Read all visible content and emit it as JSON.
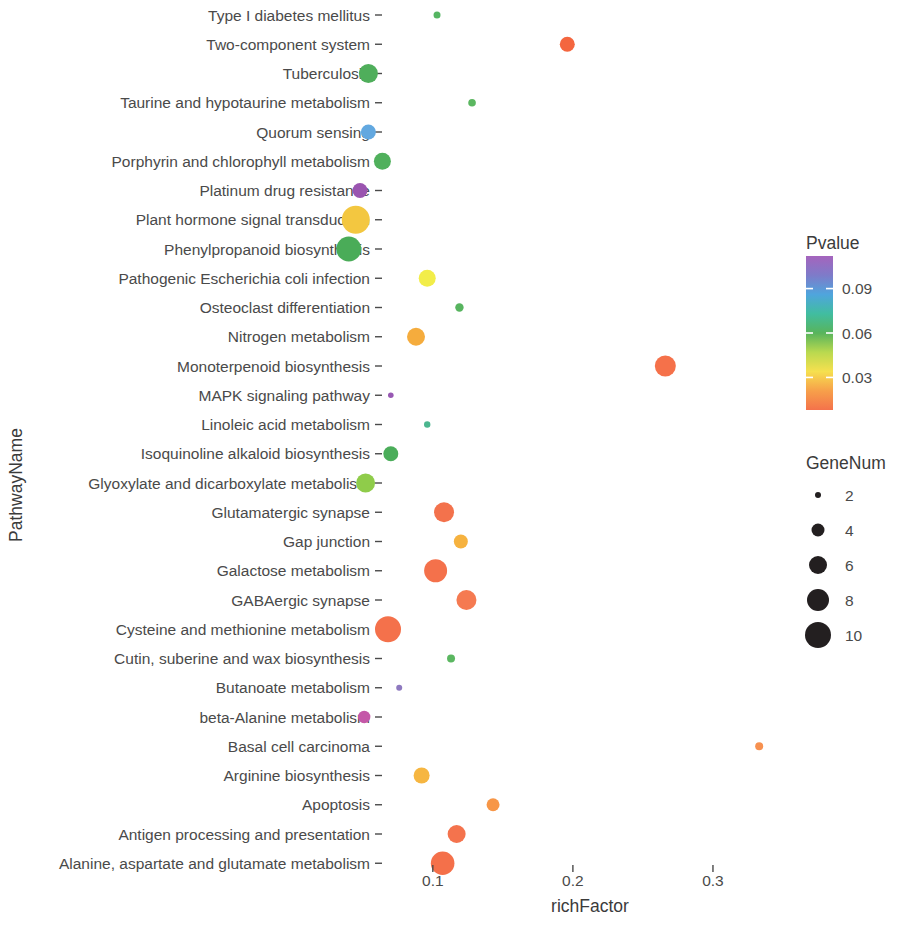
{
  "chart_data": {
    "type": "scatter",
    "title": "",
    "xlabel": "richFactor",
    "ylabel": "PathwayName",
    "xlim": [
      0.068,
      0.355
    ],
    "xticks": [
      0.1,
      0.2,
      0.3
    ],
    "xtick_labels": [
      "0.1",
      "0.2",
      "0.3"
    ],
    "grid": false,
    "legend_position": "right",
    "color_legend": {
      "title": "Pvalue",
      "ticks": [
        0.09,
        0.06,
        0.03
      ],
      "tick_labels": [
        "0.09",
        "0.06",
        "0.03"
      ],
      "range": [
        0.008,
        0.112
      ],
      "colormap": [
        "#f4724b",
        "#f7a04a",
        "#f6e04f",
        "#b9d94f",
        "#58b45c",
        "#41bda0",
        "#4fa5dd",
        "#7e7bc9",
        "#a564bd"
      ],
      "note": "rainbow scale: low p = orange/red (bottom), high p = purple (top)"
    },
    "size_legend": {
      "title": "GeneNum",
      "values": [
        2,
        4,
        6,
        8,
        10
      ],
      "labels": [
        "2",
        "4",
        "6",
        "8",
        "10"
      ],
      "radii": [
        3,
        6.5,
        9,
        11,
        13
      ],
      "color": "#231f20"
    },
    "categories": [
      "Type I diabetes mellitus",
      "Two-component system",
      "Tuberculosis",
      "Taurine and hypotaurine metabolism",
      "Quorum sensing",
      "Porphyrin and chlorophyll metabolism",
      "Platinum drug resistance",
      "Plant hormone signal transduction",
      "Phenylpropanoid biosynthesis",
      "Pathogenic Escherichia coli infection",
      "Osteoclast differentiation",
      "Nitrogen metabolism",
      "Monoterpenoid biosynthesis",
      "MAPK signaling pathway",
      "Linoleic acid metabolism",
      "Isoquinoline alkaloid biosynthesis",
      "Glyoxylate and dicarboxylate metabolism",
      "Glutamatergic synapse",
      "Gap junction",
      "Galactose metabolism",
      "GABAergic synapse",
      "Cysteine and methionine metabolism",
      "Cutin, suberine and wax biosynthesis",
      "Butanoate metabolism",
      "beta-Alanine metabolism",
      "Basal cell carcinoma",
      "Arginine biosynthesis",
      "Apoptosis",
      "Antigen processing and presentation",
      "Alanine, aspartate and glutamate metabolism"
    ],
    "points": [
      {
        "pathway": "Type I diabetes mellitus",
        "richFactor": 0.103,
        "geneNum": 2,
        "pvalue": 0.055,
        "color": "#55b562",
        "radius": 3.5
      },
      {
        "pathway": "Two-component system",
        "richFactor": 0.196,
        "geneNum": 5,
        "pvalue": 0.014,
        "color": "#f4663f",
        "radius": 7.5
      },
      {
        "pathway": "Tuberculosis",
        "richFactor": 0.054,
        "geneNum": 7,
        "pvalue": 0.051,
        "color": "#4fae5b",
        "radius": 9.5
      },
      {
        "pathway": "Taurine and hypotaurine metabolism",
        "richFactor": 0.128,
        "geneNum": 2,
        "pvalue": 0.052,
        "color": "#5bb760",
        "radius": 3.8
      },
      {
        "pathway": "Quorum sensing",
        "richFactor": 0.054,
        "geneNum": 5,
        "pvalue": 0.081,
        "color": "#62a8e0",
        "radius": 7.5
      },
      {
        "pathway": "Porphyrin and chlorophyll metabolism",
        "richFactor": 0.064,
        "geneNum": 6,
        "pvalue": 0.05,
        "color": "#50b05c",
        "radius": 8.5
      },
      {
        "pathway": "Platinum drug resistance",
        "richFactor": 0.048,
        "geneNum": 5,
        "pvalue": 0.104,
        "color": "#9a55b0",
        "radius": 7.5
      },
      {
        "pathway": "Plant hormone signal transduction",
        "richFactor": 0.045,
        "geneNum": 10,
        "pvalue": 0.034,
        "color": "#f3c740",
        "radius": 14.0
      },
      {
        "pathway": "Phenylpropanoid biosynthesis",
        "richFactor": 0.04,
        "geneNum": 9,
        "pvalue": 0.049,
        "color": "#4aac58",
        "radius": 12.5
      },
      {
        "pathway": "Pathogenic Escherichia coli infection",
        "richFactor": 0.096,
        "geneNum": 6,
        "pvalue": 0.038,
        "color": "#f2ed49",
        "radius": 8.5
      },
      {
        "pathway": "Osteoclast differentiation",
        "richFactor": 0.119,
        "geneNum": 2,
        "pvalue": 0.053,
        "color": "#57b45f",
        "radius": 4.2
      },
      {
        "pathway": "Nitrogen metabolism",
        "richFactor": 0.088,
        "geneNum": 6,
        "pvalue": 0.029,
        "color": "#f5ac3d",
        "radius": 9.0
      },
      {
        "pathway": "Monoterpenoid biosynthesis",
        "richFactor": 0.266,
        "geneNum": 7,
        "pvalue": 0.016,
        "color": "#f5714a",
        "radius": 10.5
      },
      {
        "pathway": "MAPK signaling pathway",
        "richFactor": 0.07,
        "geneNum": 1,
        "pvalue": 0.1,
        "color": "#9859b3",
        "radius": 2.8
      },
      {
        "pathway": "Linoleic acid metabolism",
        "richFactor": 0.096,
        "geneNum": 1,
        "pvalue": 0.064,
        "color": "#4bb68f",
        "radius": 3.2
      },
      {
        "pathway": "Isoquinoline alkaloid biosynthesis",
        "richFactor": 0.07,
        "geneNum": 5,
        "pvalue": 0.049,
        "color": "#4bad5a",
        "radius": 7.5
      },
      {
        "pathway": "Glyoxylate and dicarboxylate metabolism",
        "richFactor": 0.052,
        "geneNum": 6,
        "pvalue": 0.043,
        "color": "#8fcc4a",
        "radius": 9.5
      },
      {
        "pathway": "Glutamatergic synapse",
        "richFactor": 0.108,
        "geneNum": 7,
        "pvalue": 0.017,
        "color": "#f3724c",
        "radius": 10.0
      },
      {
        "pathway": "Gap junction",
        "richFactor": 0.12,
        "geneNum": 4,
        "pvalue": 0.03,
        "color": "#f6b23f",
        "radius": 7.0
      },
      {
        "pathway": "Galactose metabolism",
        "richFactor": 0.102,
        "geneNum": 8,
        "pvalue": 0.017,
        "color": "#f4714b",
        "radius": 11.5
      },
      {
        "pathway": "GABAergic synapse",
        "richFactor": 0.124,
        "geneNum": 7,
        "pvalue": 0.019,
        "color": "#f57a51",
        "radius": 10.0
      },
      {
        "pathway": "Cysteine and methionine metabolism",
        "richFactor": 0.068,
        "geneNum": 9,
        "pvalue": 0.016,
        "color": "#f4714b",
        "radius": 13.0
      },
      {
        "pathway": "Cutin, suberine and wax biosynthesis",
        "richFactor": 0.113,
        "geneNum": 2,
        "pvalue": 0.052,
        "color": "#5bb761",
        "radius": 4.0
      },
      {
        "pathway": "Butanoate metabolism",
        "richFactor": 0.076,
        "geneNum": 1,
        "pvalue": 0.098,
        "color": "#8e79bf",
        "radius": 3.0
      },
      {
        "pathway": "beta-Alanine metabolism",
        "richFactor": 0.051,
        "geneNum": 4,
        "pvalue": 0.107,
        "color": "#c458a8",
        "radius": 6.2
      },
      {
        "pathway": "Basal cell carcinoma",
        "richFactor": 0.333,
        "geneNum": 2,
        "pvalue": 0.024,
        "color": "#f79150",
        "radius": 4.0
      },
      {
        "pathway": "Arginine biosynthesis",
        "richFactor": 0.092,
        "geneNum": 5,
        "pvalue": 0.031,
        "color": "#f6b641",
        "radius": 8.0
      },
      {
        "pathway": "Apoptosis",
        "richFactor": 0.143,
        "geneNum": 4,
        "pvalue": 0.026,
        "color": "#f79647",
        "radius": 6.5
      },
      {
        "pathway": "Antigen processing and presentation",
        "richFactor": 0.117,
        "geneNum": 6,
        "pvalue": 0.018,
        "color": "#f4734d",
        "radius": 9.0
      },
      {
        "pathway": "Alanine, aspartate and glutamate metabolism",
        "richFactor": 0.107,
        "geneNum": 8,
        "pvalue": 0.016,
        "color": "#f4704a",
        "radius": 11.8
      }
    ]
  }
}
